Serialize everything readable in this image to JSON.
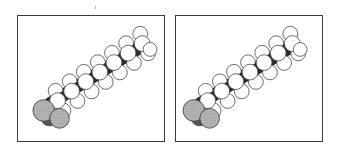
{
  "figure": {
    "type": "stereo pair",
    "panels": [
      {
        "id": "left",
        "label": "",
        "view": "left-eye"
      },
      {
        "id": "right",
        "label": "",
        "view": "right-eye"
      }
    ]
  },
  "colors": {
    "frame": "#3a3a3a",
    "atom_fill": "#ffffff",
    "atom_outline": "#444444",
    "backbone": "#2b2b2b",
    "head_group": "#9a9a9a"
  }
}
